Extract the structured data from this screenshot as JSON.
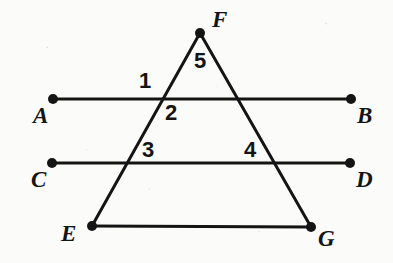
{
  "figure": {
    "type": "geometry-diagram",
    "colors": {
      "ink": "#141414",
      "background": "#fbfbfa"
    },
    "style": {
      "line_width": 3,
      "vertex_dot_radius": 5
    },
    "points": [
      {
        "name": "F",
        "label": "F",
        "x": 200,
        "y": 33,
        "label_x": 212,
        "label_y": 8,
        "dot": true
      },
      {
        "name": "A",
        "label": "A",
        "x": 53,
        "y": 99,
        "label_x": 33,
        "label_y": 104,
        "dot": true
      },
      {
        "name": "B",
        "label": "B",
        "x": 351,
        "y": 99,
        "label_x": 357,
        "label_y": 104,
        "dot": true
      },
      {
        "name": "C",
        "label": "C",
        "x": 52,
        "y": 163,
        "label_x": 31,
        "label_y": 168,
        "dot": true
      },
      {
        "name": "D",
        "label": "D",
        "x": 350,
        "y": 163,
        "label_x": 356,
        "label_y": 168,
        "dot": true
      },
      {
        "name": "E",
        "label": "E",
        "x": 92,
        "y": 226,
        "label_x": 61,
        "label_y": 222,
        "dot": true
      },
      {
        "name": "G",
        "label": "G",
        "x": 311,
        "y": 227,
        "label_x": 318,
        "label_y": 227,
        "dot": true
      }
    ],
    "segments": [
      {
        "name": "line-AB",
        "from": "A",
        "to": "B",
        "x1": 53,
        "y1": 99,
        "x2": 351,
        "y2": 99
      },
      {
        "name": "line-CD",
        "from": "C",
        "to": "D",
        "x1": 52,
        "y1": 163,
        "x2": 350,
        "y2": 163
      },
      {
        "name": "side-EG",
        "from": "E",
        "to": "G",
        "x1": 92,
        "y1": 226,
        "x2": 311,
        "y2": 227
      },
      {
        "name": "side-FE",
        "from": "F",
        "to": "E",
        "x1": 200,
        "y1": 33,
        "x2": 92,
        "y2": 226
      },
      {
        "name": "side-FG",
        "from": "F",
        "to": "G",
        "x1": 200,
        "y1": 33,
        "x2": 311,
        "y2": 227
      }
    ],
    "angle_labels": [
      {
        "name": "angle-1",
        "label": "1",
        "x": 139,
        "y": 70
      },
      {
        "name": "angle-2",
        "label": "2",
        "x": 165,
        "y": 102
      },
      {
        "name": "angle-3",
        "label": "3",
        "x": 142,
        "y": 139
      },
      {
        "name": "angle-4",
        "label": "4",
        "x": 244,
        "y": 139
      },
      {
        "name": "angle-5",
        "label": "5",
        "x": 194,
        "y": 50
      }
    ]
  }
}
